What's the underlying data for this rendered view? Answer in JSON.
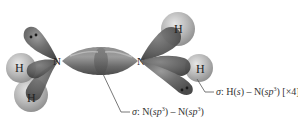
{
  "diagram": {
    "molecule": "N2H4",
    "atoms": [
      {
        "id": "N1",
        "label": "N",
        "x": 58,
        "y": 61
      },
      {
        "id": "N2",
        "label": "N",
        "x": 140,
        "y": 61
      },
      {
        "id": "H1",
        "label": "H",
        "x": 20,
        "y": 68
      },
      {
        "id": "H2",
        "label": "H",
        "x": 30,
        "y": 96
      },
      {
        "id": "H3",
        "label": "H",
        "x": 178,
        "y": 28
      },
      {
        "id": "H4",
        "label": "H",
        "x": 200,
        "y": 69
      }
    ],
    "labels": {
      "nh_bond": {
        "sigma": "σ",
        "prefix": ": H(",
        "s": "s",
        "mid": ") – N(",
        "sp": "sp",
        "sup": "3",
        "suffix": ") [×4]"
      },
      "nn_bond": {
        "sigma": "σ",
        "prefix": ": N(",
        "sp1": "sp",
        "sup1": "3",
        "mid": ") – N(",
        "sp2": "sp",
        "sup2": "3",
        "suffix": ")"
      }
    },
    "colors": {
      "orbital_dark": "#5e5e5e",
      "orbital_mid": "#7a7a7a",
      "orbital_light": "#a8a8a8",
      "hydrogen": "#b5b5b5",
      "hydrogen_light": "#d8d8d8",
      "leader_line": "#555555",
      "text": "#222222"
    }
  }
}
